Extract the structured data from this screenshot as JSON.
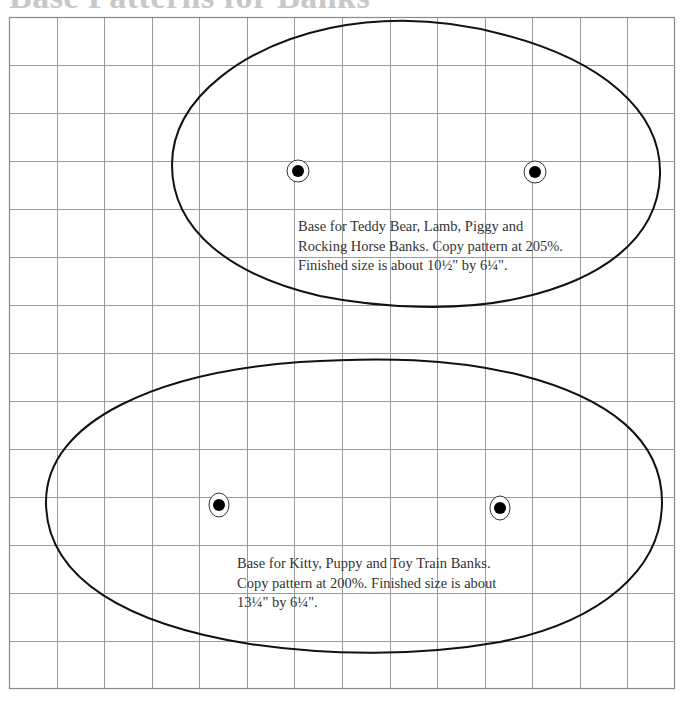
{
  "title": "Base Patterns for Banks",
  "grid": {
    "left": 9,
    "top": 17,
    "right": 675,
    "bottom": 689,
    "columns": 14,
    "rows": 14,
    "line_color": "#9a9a9a",
    "border_color": "#8a8a8a"
  },
  "patterns": [
    {
      "name": "upper-base",
      "caption_lines": [
        "Base for Teddy Bear, Lamb, Piggy and",
        "Rocking Horse Banks. Copy pattern at 205%.",
        "Finished size is about 10½\" by 6¼\"."
      ],
      "copy_percent": "205%",
      "finished_size": "10½\" by 6¼\"",
      "holes": [
        {
          "x": 298,
          "y": 171
        },
        {
          "x": 535,
          "y": 172
        }
      ]
    },
    {
      "name": "lower-base",
      "caption_lines": [
        "Base for Kitty, Puppy and Toy Train Banks.",
        "Copy pattern at 200%. Finished size is about",
        "13¼\" by 6¼\"."
      ],
      "copy_percent": "200%",
      "finished_size": "13¼\" by 6¼\"",
      "holes": [
        {
          "x": 219,
          "y": 505
        },
        {
          "x": 500,
          "y": 508
        }
      ]
    }
  ]
}
